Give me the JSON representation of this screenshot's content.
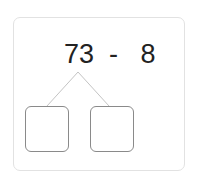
{
  "problem": {
    "left_operand": "73",
    "operator": "-",
    "right_operand": "8",
    "expression": "73  -   8"
  },
  "boxes": [
    {
      "value": ""
    },
    {
      "value": ""
    }
  ],
  "colors": {
    "card_border": "#e2e2e2",
    "box_border": "#8a8a8a",
    "line": "#c4c4c4",
    "text": "#222222"
  }
}
